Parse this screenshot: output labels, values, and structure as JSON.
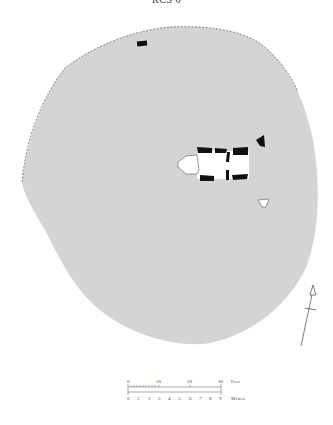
{
  "title": "RCS 6",
  "colors": {
    "site_fill": "#d4d4d4",
    "stone_fill": "#111111",
    "interior_fill": "#ffffff",
    "outline": "#555555"
  },
  "scale_bar": {
    "feet_label": "Feet",
    "metres_label": "Metres",
    "feet_ticks": [
      "0",
      "10",
      "20",
      "30"
    ],
    "metre_ticks": [
      "0",
      "1",
      "2",
      "3",
      "4",
      "5",
      "6",
      "7",
      "8",
      "9"
    ]
  },
  "north_arrow": {
    "icon": "north-arrow-icon"
  }
}
